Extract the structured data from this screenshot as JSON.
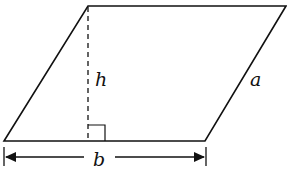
{
  "diagram": {
    "shape": "parallelogram",
    "labels": {
      "height": "h",
      "side": "a",
      "base": "b"
    },
    "colors": {
      "stroke": "#111111",
      "background": "#ffffff"
    }
  }
}
